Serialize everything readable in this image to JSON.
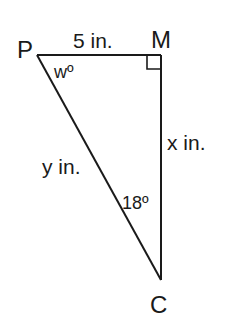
{
  "figure": {
    "type": "right-triangle",
    "stroke_color": "#1a1a1a",
    "background": "#ffffff",
    "vertices": {
      "P": {
        "label": "P"
      },
      "M": {
        "label": "M"
      },
      "C": {
        "label": "C"
      }
    },
    "sides": {
      "PM": {
        "label": "5 in."
      },
      "MC": {
        "label": "x in."
      },
      "PC": {
        "label": "y in."
      }
    },
    "angles": {
      "P": {
        "label": "wº"
      },
      "C": {
        "label": "18º"
      },
      "M": {
        "marker": "right-angle"
      }
    }
  }
}
